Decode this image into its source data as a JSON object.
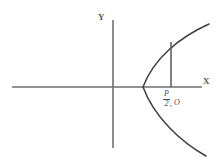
{
  "figure": {
    "name": "rightward-opening-parabola",
    "background_color": "#ffffff",
    "width": 222,
    "height": 168
  },
  "axes": {
    "x_axis": {
      "label": "X",
      "color": "#6e6e70",
      "y_position": 87,
      "x_start": 12,
      "x_end": 202
    },
    "y_axis": {
      "label": "Y",
      "color": "#6e6e70",
      "x_position": 113,
      "y_start": 20,
      "y_end": 148
    }
  },
  "curve": {
    "name": "parabola",
    "color": "#3f3f41",
    "orientation": "opens-right",
    "vertex": {
      "x": 143,
      "y": 87
    },
    "upper_endpoint": {
      "x": 209,
      "y": 24
    },
    "lower_endpoint": {
      "x": 206,
      "y": 156
    }
  },
  "chord": {
    "name": "latus-rectum-half-segment",
    "color": "#58585a",
    "x_position": 171,
    "y_top": 42,
    "y_bottom": 87
  },
  "annotation": {
    "numerator": "P",
    "denominator": "2",
    "separator": ",",
    "origin_label": "O"
  }
}
